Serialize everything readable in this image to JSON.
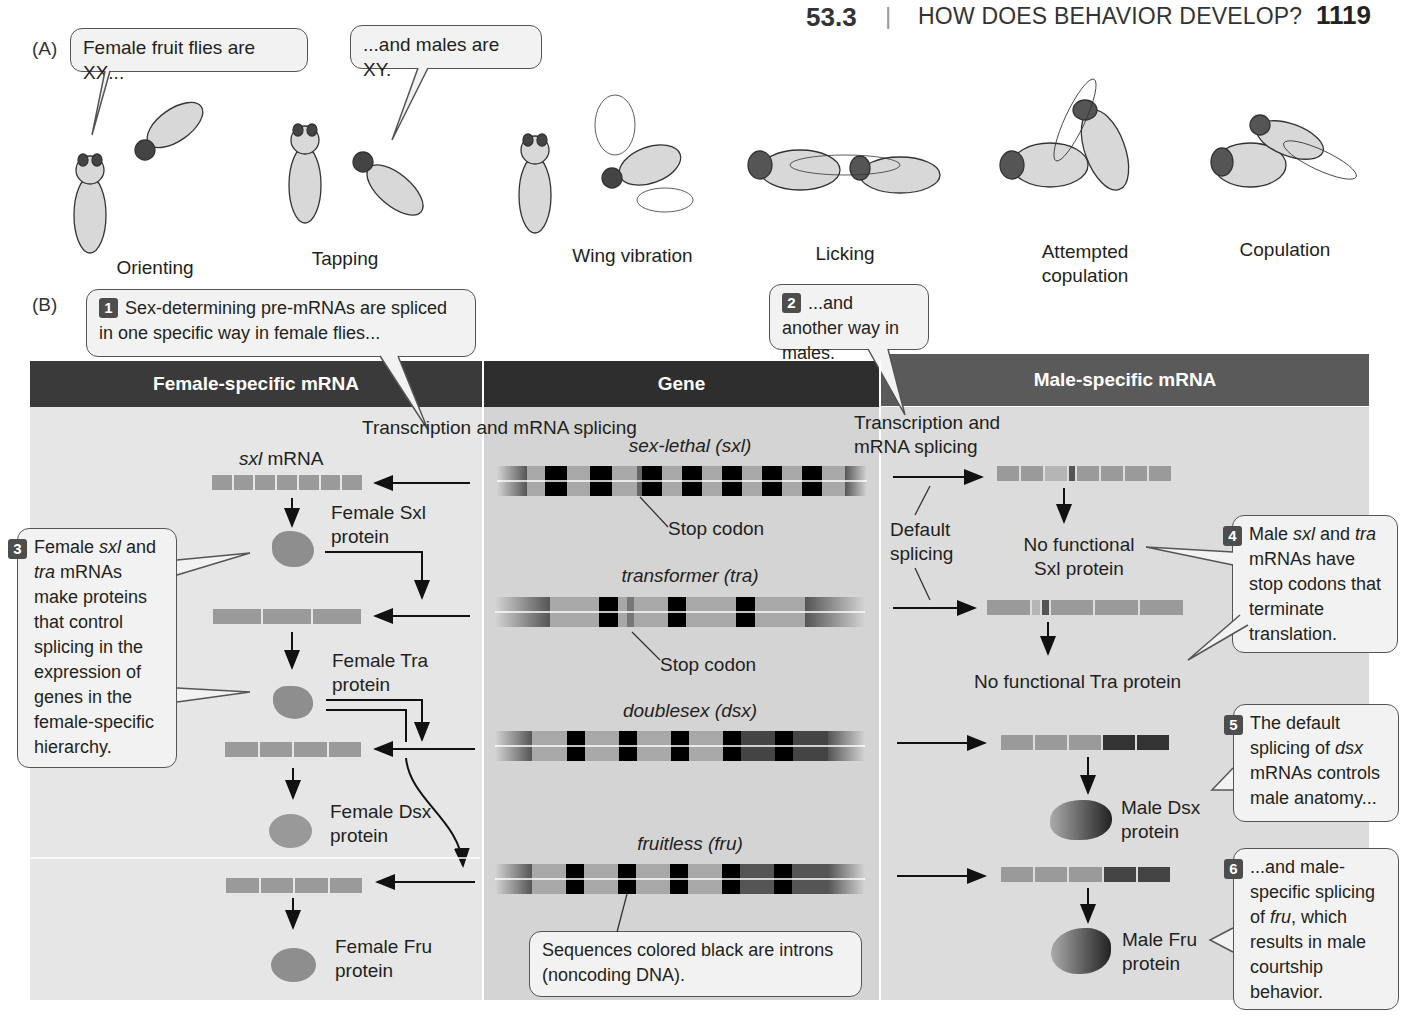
{
  "header": {
    "section_number": "53.3",
    "separator": "|",
    "section_title": "HOW DOES BEHAVIOR DEVELOP?",
    "page_number": "1119"
  },
  "panel_a": {
    "label": "(A)",
    "callouts": [
      {
        "text": "Female fruit flies are XX..."
      },
      {
        "text": "...and males are XY."
      }
    ],
    "behaviors": [
      "Orienting",
      "Tapping",
      "Wing vibration",
      "Licking",
      "Attempted copulation",
      "Copulation"
    ]
  },
  "panel_b": {
    "label": "(B)",
    "columns": {
      "female": "Female-specific mRNA",
      "gene": "Gene",
      "male": "Male-specific mRNA"
    },
    "colors": {
      "female_header": "#3a3a3a",
      "gene_header": "#2e2e2e",
      "male_header": "#5a5a5a",
      "female_bg": "#e6e6e6",
      "gene_bg": "#d6d6d6",
      "male_bg": "#dcdcdc",
      "intron": "#000000",
      "exon": "#9a9a9a"
    },
    "steps": [
      {
        "num": "1",
        "text": "Sex-determining pre-mRNAs are spliced in one specific way in female flies..."
      },
      {
        "num": "2",
        "text": "...and another way in males."
      },
      {
        "num": "3",
        "text_parts": [
          "Female ",
          "sxl",
          " and ",
          "tra",
          " mRNAs make proteins that control splicing in the expression of genes in the female-specific hierarchy."
        ]
      },
      {
        "num": "4",
        "text_parts": [
          "Male ",
          "sxl",
          " and ",
          "tra",
          " mRNAs have stop codons that terminate translation."
        ]
      },
      {
        "num": "5",
        "text_parts": [
          "The default splicing of ",
          "dsx",
          " mRNAs controls male anatomy..."
        ]
      },
      {
        "num": "6",
        "text_parts": [
          "...and male-specific splicing of ",
          "fru",
          ", which results in male courtship behavior."
        ]
      }
    ],
    "labels": {
      "transcription_left": "Transcription and mRNA splicing",
      "transcription_right": "Transcription and mRNA splicing",
      "sxl_mrna_italic": "sxl",
      "sxl_mrna_rest": " mRNA",
      "stop_codon_1": "Stop codon",
      "stop_codon_2": "Stop codon",
      "default_splicing": "Default splicing",
      "female_sxl_protein": "Female Sxl protein",
      "female_tra_protein": "Female Tra protein",
      "female_dsx_protein": "Female Dsx protein",
      "female_fru_protein": "Female Fru protein",
      "no_sxl": "No functional Sxl protein",
      "no_tra": "No functional Tra protein",
      "male_dsx_protein": "Male Dsx protein",
      "male_fru_protein": "Male Fru protein",
      "intron_note": "Sequences colored black are introns (noncoding DNA)."
    },
    "genes": [
      {
        "name": "sex-lethal (sxl)"
      },
      {
        "name": "transformer (tra)"
      },
      {
        "name": "doublesex (dsx)"
      },
      {
        "name": "fruitless (fru)"
      }
    ]
  }
}
